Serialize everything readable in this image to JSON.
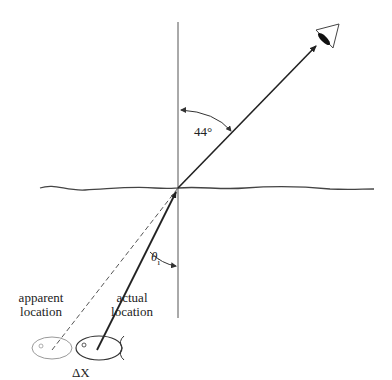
{
  "diagram": {
    "labels": {
      "refracted_angle": "44°",
      "incident_angle": "θ",
      "incident_angle_sub": "i",
      "apparent_line1": "apparent",
      "apparent_line2": "location",
      "actual_line1": "actual",
      "actual_line2": "location",
      "displacement": "ΔX"
    },
    "elements": {
      "normal_line": "vertical normal",
      "water_surface": "wavy water surface",
      "observer": "eye-icon",
      "real_fish": "fish at actual location",
      "image_fish": "fish at apparent location (gray)"
    },
    "colors": {
      "line": "#333333",
      "ghost": "#9a9a9a",
      "background": "#ffffff"
    }
  }
}
